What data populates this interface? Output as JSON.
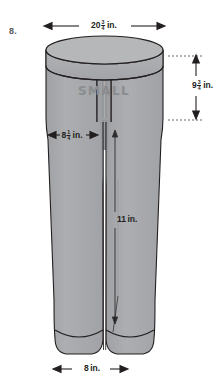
{
  "problem": {
    "number": "8."
  },
  "figure": {
    "name": "pants-diagram",
    "brand_label": "SMALL",
    "colors": {
      "fabric": "#a7a9ac",
      "fabric_shade": "#9b9da0",
      "waistband_top": "#b5b7b9",
      "outline": "#231f20",
      "label_text": "#231f20",
      "brand_text": "#8a8c8e",
      "background": "#ffffff"
    }
  },
  "dimensions": {
    "waist_width": {
      "whole": "20",
      "num": "3",
      "den": "4",
      "unit": "in."
    },
    "rise_height": {
      "whole": "9",
      "num": "3",
      "den": "4",
      "unit": "in."
    },
    "hip_width": {
      "whole": "8",
      "num": "1",
      "den": "4",
      "unit": "in."
    },
    "inseam": {
      "whole": "11",
      "num": "",
      "den": "",
      "unit": "in."
    },
    "cuff_width": {
      "whole": "8",
      "num": "",
      "den": "",
      "unit": "in."
    }
  }
}
